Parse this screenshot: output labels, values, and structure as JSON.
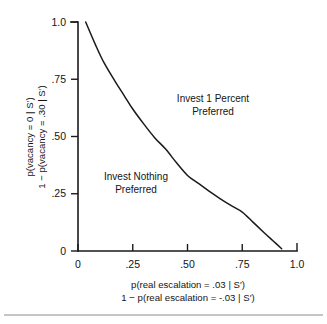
{
  "chart_data": {
    "type": "line",
    "title": "",
    "subtitle": "",
    "xlabel_line1": "p(real escalation = .03 | S′)",
    "xlabel_line2": "1 − p(real escalation = -.03 | S′)",
    "ylabel_line1": "p(vacancy = 0 | S′)",
    "ylabel_line2": "1 − p(vacancy = .30 | S′)",
    "xlim": [
      0,
      1.0
    ],
    "ylim": [
      0,
      1.0
    ],
    "grid": false,
    "legend": "none",
    "xticks": [
      0,
      0.25,
      0.5,
      0.75,
      1.0
    ],
    "xtick_labels": [
      "0",
      ".25",
      ".50",
      ".75",
      "1.0"
    ],
    "yticks": [
      0,
      0.25,
      0.5,
      0.75,
      1.0
    ],
    "ytick_labels": [
      "0",
      ".25",
      ".50",
      ".75",
      "1.0"
    ],
    "series": [
      {
        "name": "indifference curve",
        "x": [
          0.035,
          0.08,
          0.12,
          0.17,
          0.21,
          0.25,
          0.3,
          0.35,
          0.4,
          0.45,
          0.5,
          0.55,
          0.6,
          0.65,
          0.7,
          0.75,
          0.8,
          0.85,
          0.89,
          0.93
        ],
        "y": [
          1.0,
          0.9,
          0.82,
          0.74,
          0.68,
          0.62,
          0.555,
          0.495,
          0.445,
          0.385,
          0.33,
          0.295,
          0.26,
          0.228,
          0.198,
          0.17,
          0.125,
          0.08,
          0.045,
          0.01
        ]
      }
    ],
    "annotations": [
      {
        "text_line1": "Invest 1 Percent",
        "text_line2": "Preferred",
        "x": 0.6,
        "y": 0.66
      },
      {
        "text_line1": "Invest Nothing",
        "text_line2": "Preferred",
        "x": 0.27,
        "y": 0.26
      }
    ]
  }
}
